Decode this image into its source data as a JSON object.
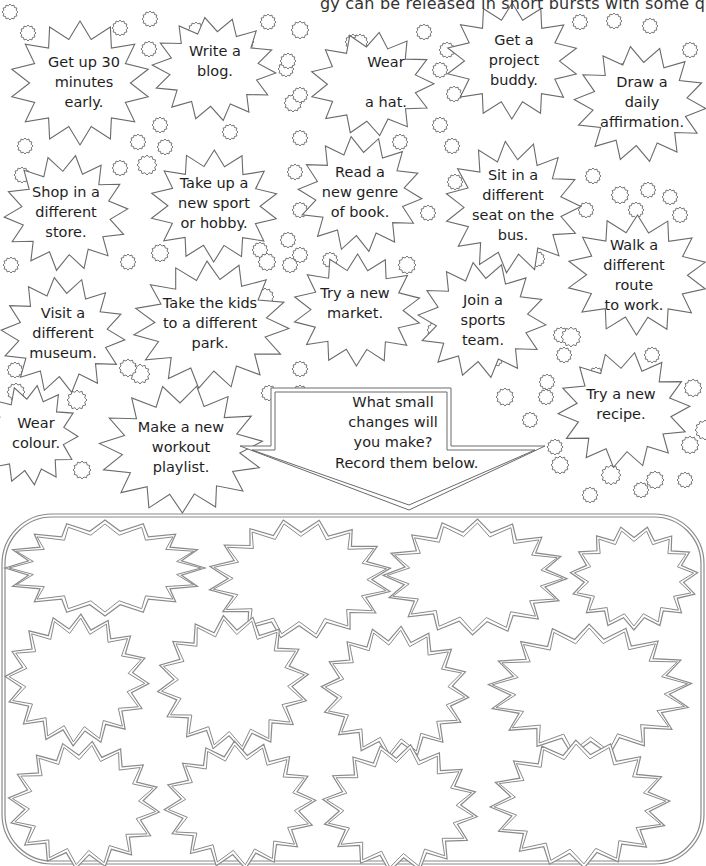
{
  "page": {
    "intro_text": "gy can be released in short bursts with some quick, simple changes."
  },
  "colors": {
    "outline": "#6a6a6a",
    "lower_outline": "#8a8a8a",
    "text": "#1e1e1e",
    "background": "#ffffff"
  },
  "ideas": [
    {
      "label": "Get up 30\nminutes\nearly.",
      "cx": 80,
      "cy": 83,
      "rx": 70,
      "ry": 62,
      "points": 14,
      "tx": 84,
      "ty": 82
    },
    {
      "label": "Write a\nblog.",
      "cx": 214,
      "cy": 69,
      "rx": 62,
      "ry": 52,
      "points": 14,
      "tx": 215,
      "ty": 61
    },
    {
      "label": "Wear\n\na hat.",
      "cx": 372,
      "cy": 84,
      "rx": 62,
      "ry": 52,
      "points": 13,
      "tx": 386,
      "ty": 82
    },
    {
      "label": "Get a\nproject\nbuddy.",
      "cx": 512,
      "cy": 61,
      "rx": 66,
      "ry": 58,
      "points": 14,
      "tx": 514,
      "ty": 60
    },
    {
      "label": "Draw a\ndaily\naffirmation.",
      "cx": 640,
      "cy": 104,
      "rx": 66,
      "ry": 58,
      "points": 14,
      "tx": 642,
      "ty": 102
    },
    {
      "label": "Shop in a\ndifferent\nstore.",
      "cx": 66,
      "cy": 213,
      "rx": 62,
      "ry": 58,
      "points": 14,
      "tx": 66,
      "ty": 212
    },
    {
      "label": "Take up a\nnew sport\nor hobby.",
      "cx": 214,
      "cy": 206,
      "rx": 64,
      "ry": 56,
      "points": 14,
      "tx": 214,
      "ty": 203
    },
    {
      "label": "Read a\nnew genre\nof book.",
      "cx": 360,
      "cy": 194,
      "rx": 62,
      "ry": 58,
      "points": 14,
      "tx": 360,
      "ty": 192
    },
    {
      "label": "Sit in a\ndifferent\nseat on the\nbus.",
      "cx": 513,
      "cy": 207,
      "rx": 68,
      "ry": 66,
      "points": 15,
      "tx": 513,
      "ty": 205
    },
    {
      "label": "Walk a\ndifferent route\nto work.",
      "cx": 637,
      "cy": 275,
      "rx": 70,
      "ry": 60,
      "points": 14,
      "tx": 634,
      "ty": 275
    },
    {
      "label": "Visit a\ndifferent\nmuseum.",
      "cx": 63,
      "cy": 335,
      "rx": 62,
      "ry": 58,
      "points": 14,
      "tx": 63,
      "ty": 333
    },
    {
      "label": "Take the kids\nto a different\npark.",
      "cx": 211,
      "cy": 325,
      "rx": 78,
      "ry": 64,
      "points": 15,
      "tx": 210,
      "ty": 323
    },
    {
      "label": "Try a new\nmarket.",
      "cx": 357,
      "cy": 310,
      "rx": 64,
      "ry": 56,
      "points": 14,
      "tx": 355,
      "ty": 303
    },
    {
      "label": "Join a\nsports\nteam.",
      "cx": 482,
      "cy": 320,
      "rx": 64,
      "ry": 58,
      "points": 14,
      "tx": 483,
      "ty": 320
    },
    {
      "label": "Try a new\nrecipe.",
      "cx": 624,
      "cy": 410,
      "rx": 66,
      "ry": 58,
      "points": 14,
      "tx": 621,
      "ty": 404
    },
    {
      "label": "Wear\ncolour.",
      "cx": 30,
      "cy": 435,
      "rx": 48,
      "ry": 50,
      "points": 13,
      "tx": 36,
      "ty": 433
    },
    {
      "label": "Make a new\nworkout\nplaylist.",
      "cx": 181,
      "cy": 449,
      "rx": 82,
      "ry": 64,
      "points": 15,
      "tx": 181,
      "ty": 447
    }
  ],
  "prompt_arrow": {
    "line1": "What small\nchanges will\nyou make?",
    "line2": "Record them below."
  },
  "record_box": {
    "bursts": [
      {
        "cx": 105,
        "cy": 568,
        "rx": 100,
        "ry": 48,
        "points": 16
      },
      {
        "cx": 300,
        "cy": 579,
        "rx": 92,
        "ry": 60,
        "points": 16
      },
      {
        "cx": 475,
        "cy": 577,
        "rx": 92,
        "ry": 58,
        "points": 16
      },
      {
        "cx": 634,
        "cy": 578,
        "rx": 64,
        "ry": 52,
        "points": 15
      },
      {
        "cx": 77,
        "cy": 680,
        "rx": 72,
        "ry": 66,
        "points": 16
      },
      {
        "cx": 233,
        "cy": 683,
        "rx": 76,
        "ry": 68,
        "points": 16
      },
      {
        "cx": 395,
        "cy": 692,
        "rx": 74,
        "ry": 66,
        "points": 16
      },
      {
        "cx": 590,
        "cy": 690,
        "rx": 102,
        "ry": 66,
        "points": 17
      },
      {
        "cx": 84,
        "cy": 805,
        "rx": 76,
        "ry": 64,
        "points": 16
      },
      {
        "cx": 240,
        "cy": 805,
        "rx": 76,
        "ry": 64,
        "points": 16
      },
      {
        "cx": 400,
        "cy": 808,
        "rx": 78,
        "ry": 64,
        "points": 16
      },
      {
        "cx": 580,
        "cy": 804,
        "rx": 90,
        "ry": 64,
        "points": 16
      }
    ]
  },
  "decor_suns": [
    [
      28,
      33,
      8
    ],
    [
      120,
      28,
      8
    ],
    [
      150,
      19,
      8
    ],
    [
      196,
      30,
      8
    ],
    [
      268,
      22,
      8
    ],
    [
      246,
      42,
      8
    ],
    [
      300,
      30,
      9
    ],
    [
      353,
      42,
      8
    ],
    [
      424,
      32,
      8
    ],
    [
      447,
      50,
      8
    ],
    [
      580,
      22,
      8
    ],
    [
      614,
      21,
      8
    ],
    [
      650,
      26,
      8
    ],
    [
      690,
      50,
      8
    ],
    [
      628,
      68,
      8
    ],
    [
      149,
      49,
      8
    ],
    [
      286,
      69,
      8
    ],
    [
      293,
      103,
      9
    ],
    [
      230,
      132,
      8
    ],
    [
      160,
      125,
      8
    ],
    [
      165,
      147,
      8
    ],
    [
      138,
      142,
      8
    ],
    [
      25,
      146,
      8
    ],
    [
      10,
      12,
      8
    ],
    [
      300,
      138,
      8
    ],
    [
      360,
      42,
      8
    ],
    [
      440,
      125,
      8
    ],
    [
      452,
      146,
      8
    ],
    [
      400,
      142,
      8
    ],
    [
      288,
      61,
      8
    ],
    [
      440,
      70,
      8
    ],
    [
      300,
      95,
      8
    ],
    [
      454,
      94,
      8
    ],
    [
      455,
      182,
      8
    ],
    [
      593,
      176,
      8
    ],
    [
      620,
      195,
      9
    ],
    [
      648,
      190,
      8
    ],
    [
      670,
      197,
      8
    ],
    [
      680,
      215,
      8
    ],
    [
      586,
      210,
      8
    ],
    [
      636,
      210,
      8
    ],
    [
      22,
      175,
      8
    ],
    [
      120,
      168,
      8
    ],
    [
      147,
      165,
      10
    ],
    [
      295,
      172,
      8
    ],
    [
      288,
      240,
      8
    ],
    [
      250,
      183,
      8
    ],
    [
      300,
      210,
      8
    ],
    [
      290,
      265,
      8
    ],
    [
      428,
      213,
      8
    ],
    [
      11,
      265,
      8
    ],
    [
      128,
      262,
      8
    ],
    [
      160,
      253,
      9
    ],
    [
      15,
      370,
      8
    ],
    [
      140,
      374,
      10
    ],
    [
      260,
      250,
      8
    ],
    [
      265,
      297,
      9
    ],
    [
      267,
      262,
      9
    ],
    [
      330,
      260,
      8
    ],
    [
      407,
      265,
      9
    ],
    [
      300,
      255,
      8
    ],
    [
      435,
      330,
      8
    ],
    [
      537,
      259,
      8
    ],
    [
      561,
      335,
      8
    ],
    [
      564,
      355,
      8
    ],
    [
      547,
      382,
      8
    ],
    [
      571,
      337,
      10
    ],
    [
      652,
      355,
      8
    ],
    [
      300,
      369,
      8
    ],
    [
      269,
      393,
      8
    ],
    [
      300,
      393,
      8
    ],
    [
      495,
      359,
      8
    ],
    [
      505,
      397,
      9
    ],
    [
      596,
      375,
      8
    ],
    [
      546,
      397,
      8
    ],
    [
      693,
      388,
      9
    ],
    [
      685,
      480,
      8
    ],
    [
      705,
      430,
      10
    ],
    [
      16,
      392,
      9
    ],
    [
      77,
      400,
      10
    ],
    [
      128,
      368,
      9
    ],
    [
      82,
      470,
      9
    ],
    [
      530,
      420,
      8
    ],
    [
      560,
      465,
      9
    ],
    [
      555,
      447,
      8
    ],
    [
      611,
      475,
      10
    ],
    [
      655,
      480,
      9
    ],
    [
      690,
      445,
      9
    ],
    [
      641,
      490,
      8
    ],
    [
      590,
      495,
      8
    ]
  ]
}
